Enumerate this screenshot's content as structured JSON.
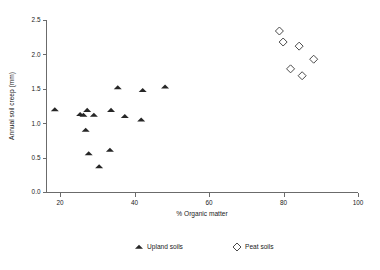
{
  "chart_data": {
    "type": "scatter",
    "title": "",
    "xlabel": "% Organic matter",
    "ylabel": "Annual soil creep (mm)",
    "xlim": [
      16,
      100
    ],
    "ylim": [
      0.0,
      2.5
    ],
    "xticks": [
      20,
      40,
      60,
      80,
      100
    ],
    "yticks": [
      "0.0",
      "0.5",
      "1.0",
      "1.5",
      "2.0",
      "2.5"
    ],
    "grid": false,
    "legend_position": "bottom-center",
    "series": [
      {
        "name": "Upland soils",
        "marker": "filled-triangle",
        "color": "#262626",
        "points": [
          {
            "x": 18.6,
            "y": 1.2
          },
          {
            "x": 25.4,
            "y": 1.13
          },
          {
            "x": 26.3,
            "y": 1.12
          },
          {
            "x": 26.9,
            "y": 0.9
          },
          {
            "x": 27.3,
            "y": 1.19
          },
          {
            "x": 27.7,
            "y": 0.56
          },
          {
            "x": 29.1,
            "y": 1.12
          },
          {
            "x": 30.5,
            "y": 0.37
          },
          {
            "x": 33.4,
            "y": 0.61
          },
          {
            "x": 33.7,
            "y": 1.19
          },
          {
            "x": 35.5,
            "y": 1.52
          },
          {
            "x": 37.4,
            "y": 1.1
          },
          {
            "x": 41.8,
            "y": 1.05
          },
          {
            "x": 42.2,
            "y": 1.48
          },
          {
            "x": 48.2,
            "y": 1.53
          }
        ]
      },
      {
        "name": "Peat soils",
        "marker": "open-diamond",
        "color": "#4a4a4a",
        "points": [
          {
            "x": 78.9,
            "y": 2.34
          },
          {
            "x": 79.9,
            "y": 2.18
          },
          {
            "x": 81.9,
            "y": 1.79
          },
          {
            "x": 84.2,
            "y": 2.12
          },
          {
            "x": 85.0,
            "y": 1.69
          },
          {
            "x": 88.1,
            "y": 1.93
          }
        ]
      }
    ]
  },
  "legend": {
    "items": [
      {
        "label": "Upland soils",
        "marker": "filled-triangle"
      },
      {
        "label": "Peat soils",
        "marker": "open-diamond"
      }
    ]
  }
}
